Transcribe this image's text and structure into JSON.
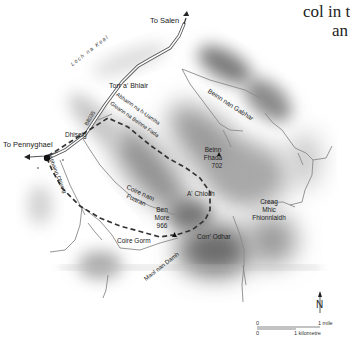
{
  "book_text": {
    "line1": "col in t",
    "line2": "an"
  },
  "map": {
    "directions": {
      "to_salen": "To Salen",
      "to_pennyghael": "To Pennyghael"
    },
    "road": {
      "number": "B8035",
      "loch": "Loch na Keal"
    },
    "places": {
      "torr_a_bhlair": "Torr a' Bhlair",
      "dhiseig": "Dhiseig",
      "beinn_nan_gabhar": "Beinn nan Gabhar",
      "abhainn_na_h_uamha": "Abhainn na h-Uamha",
      "gleann_na_beinne_fada": "Gleann na Beinne Fada",
      "abhainn_dhiseig": "Abhainn Dhiseig",
      "coire_nam_fuaran_1": "Coire nam",
      "coire_nam_fuaran_2": "Fuaran",
      "a_chioch": "A' Chioch",
      "creag_1": "Creag",
      "creag_2": "Mhic",
      "creag_3": "Fhionnlaidh",
      "coire_gorm": "Coire Gorm",
      "corr_odhar": "Corr' Odhar",
      "maol_nan_damh": "Maol nan Damh"
    },
    "peaks": {
      "beinn_fhada_1": "Beinn",
      "beinn_fhada_2": "Fhada",
      "beinn_fhada_height": "702",
      "ben_more_1": "Ben",
      "ben_more_2": "More",
      "ben_more_height": "966"
    },
    "compass": "N",
    "scale": {
      "zero_top": "0",
      "mile": "1 mile",
      "zero_bottom": "0",
      "km": "1 kilometre"
    },
    "colors": {
      "route": "#333333",
      "road": "#555555",
      "river": "#8a8a8a",
      "shade": "#6e6e6e"
    }
  }
}
